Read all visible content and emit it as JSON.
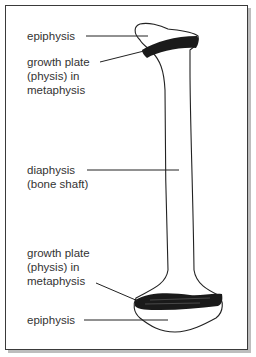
{
  "diagram": {
    "title": "",
    "labels": {
      "epiphysis_top": "epiphysis",
      "growth_plate_top": [
        "growth plate",
        "(physis) in",
        "metaphysis"
      ],
      "diaphysis": [
        "diaphysis",
        "(bone shaft)"
      ],
      "growth_plate_bottom": [
        "growth plate",
        "(physis) in",
        "metaphysis"
      ],
      "epiphysis_bottom": "epiphysis"
    },
    "colors": {
      "outline": "#222222",
      "growth_plate": "#1a1a1a",
      "text": "#333333",
      "frame": "#3a3a3a"
    }
  }
}
